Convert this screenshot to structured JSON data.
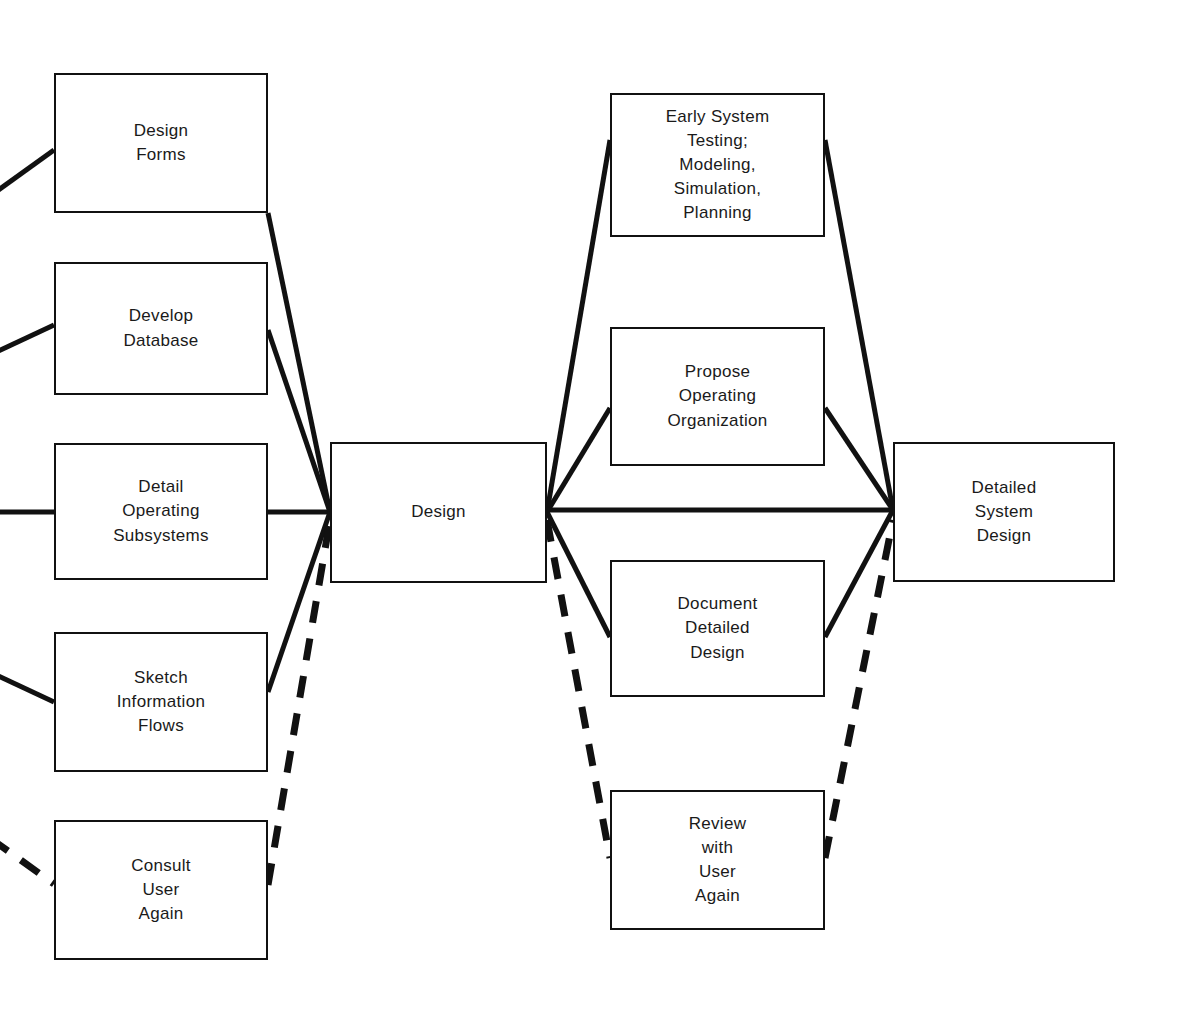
{
  "diagram": {
    "canvas": {
      "width": 1181,
      "height": 1020,
      "background": "#ffffff"
    },
    "line_color": "#111111",
    "nodes": [
      {
        "id": "design-forms",
        "label": "Design\nForms",
        "x": 54,
        "y": 73,
        "w": 214,
        "h": 140,
        "column": "left"
      },
      {
        "id": "develop-database",
        "label": "Develop\nDatabase",
        "x": 54,
        "y": 262,
        "w": 214,
        "h": 133,
        "column": "left"
      },
      {
        "id": "detail-operating-subsystems",
        "label": "Detail\nOperating\nSubsystems",
        "x": 54,
        "y": 443,
        "w": 214,
        "h": 137,
        "column": "left"
      },
      {
        "id": "sketch-information-flows",
        "label": "Sketch\nInformation\nFlows",
        "x": 54,
        "y": 632,
        "w": 214,
        "h": 140,
        "column": "left"
      },
      {
        "id": "consult-user-again",
        "label": "Consult\nUser\nAgain",
        "x": 54,
        "y": 820,
        "w": 214,
        "h": 140,
        "column": "left"
      },
      {
        "id": "design",
        "label": "Design",
        "x": 330,
        "y": 442,
        "w": 217,
        "h": 141,
        "column": "center"
      },
      {
        "id": "early-system-testing",
        "label": "Early System\nTesting;\nModeling,\nSimulation,\nPlanning",
        "x": 610,
        "y": 93,
        "w": 215,
        "h": 144,
        "column": "right"
      },
      {
        "id": "propose-operating-organization",
        "label": "Propose\nOperating\nOrganization",
        "x": 610,
        "y": 327,
        "w": 215,
        "h": 139,
        "column": "right"
      },
      {
        "id": "document-detailed-design",
        "label": "Document\nDetailed\nDesign",
        "x": 610,
        "y": 560,
        "w": 215,
        "h": 137,
        "column": "right"
      },
      {
        "id": "review-with-user-again",
        "label": "Review\nwith\nUser\nAgain",
        "x": 610,
        "y": 790,
        "w": 215,
        "h": 140,
        "column": "right"
      },
      {
        "id": "detailed-system-design",
        "label": "Detailed\nSystem\nDesign",
        "x": 893,
        "y": 442,
        "w": 222,
        "h": 140,
        "column": "far-right"
      }
    ],
    "hubs": {
      "left_hub": {
        "x": 330,
        "y": 512
      },
      "right_hub": {
        "x": 547,
        "y": 512
      },
      "final_hub": {
        "x": 893,
        "y": 510
      }
    },
    "edges": [
      {
        "id": "in-design-forms",
        "style": "solid",
        "from": "offscreen-left",
        "to": "design-forms",
        "points": "-10,196 54,150"
      },
      {
        "id": "in-develop-database",
        "style": "solid",
        "from": "offscreen-left",
        "to": "develop-database",
        "points": "-10,355 54,325"
      },
      {
        "id": "in-detail-operating-subsystems",
        "style": "solid",
        "from": "offscreen-left",
        "to": "detail-operating-subsystems",
        "points": "-10,512 54,512"
      },
      {
        "id": "in-sketch-information-flows",
        "style": "solid",
        "from": "offscreen-left",
        "to": "sketch-information-flows",
        "points": "-10,672 54,702"
      },
      {
        "id": "in-consult-user-again",
        "style": "dashed",
        "from": "offscreen-left",
        "to": "consult-user-again",
        "points": "-10,838 54,884"
      },
      {
        "id": "design-forms-to-design",
        "style": "solid",
        "from": "design-forms",
        "to": "left_hub",
        "points": "268,213 330,512"
      },
      {
        "id": "develop-database-to-design",
        "style": "solid",
        "from": "develop-database",
        "to": "left_hub",
        "points": "268,330 330,512"
      },
      {
        "id": "detail-operating-subsystems-to-design",
        "style": "solid",
        "from": "detail-operating-subsystems",
        "to": "left_hub",
        "points": "268,512 330,512"
      },
      {
        "id": "sketch-information-flows-to-design",
        "style": "solid",
        "from": "sketch-information-flows",
        "to": "left_hub",
        "points": "268,692 330,512"
      },
      {
        "id": "consult-user-again-to-design",
        "style": "dashed",
        "from": "consult-user-again",
        "to": "left_hub",
        "points": "268,885 330,520"
      },
      {
        "id": "design-to-early-system-testing",
        "style": "solid",
        "from": "right_hub",
        "to": "early-system-testing",
        "points": "547,512 610,140"
      },
      {
        "id": "design-to-propose-operating-organization",
        "style": "solid",
        "from": "right_hub",
        "to": "propose-operating-organization",
        "points": "547,512 610,408"
      },
      {
        "id": "design-to-document-detailed-design",
        "style": "solid",
        "from": "right_hub",
        "to": "document-detailed-design",
        "points": "547,512 610,637"
      },
      {
        "id": "design-to-review-with-user-again",
        "style": "dashed",
        "from": "right_hub",
        "to": "review-with-user-again",
        "points": "547,520 610,858"
      },
      {
        "id": "design-to-detailed-system-design",
        "style": "solid",
        "from": "right_hub",
        "to": "final_hub",
        "points": "547,510 893,510"
      },
      {
        "id": "early-system-testing-to-detailed-system-design",
        "style": "solid",
        "from": "early-system-testing",
        "to": "final_hub",
        "points": "825,140 893,510"
      },
      {
        "id": "propose-operating-organization-to-detailed-system-design",
        "style": "solid",
        "from": "propose-operating-organization",
        "to": "final_hub",
        "points": "825,408 893,510"
      },
      {
        "id": "document-detailed-design-to-detailed-system-design",
        "style": "solid",
        "from": "document-detailed-design",
        "to": "final_hub",
        "points": "825,637 893,510"
      },
      {
        "id": "review-with-user-again-to-detailed-system-design",
        "style": "dashed",
        "from": "review-with-user-again",
        "to": "final_hub",
        "points": "825,858 893,520"
      }
    ]
  }
}
